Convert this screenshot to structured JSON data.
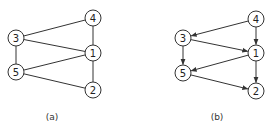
{
  "figures": [
    {
      "id": "a",
      "caption": "(a)",
      "caption_pos": [
        52,
        120
      ],
      "directed": false,
      "nodes": [
        {
          "id": "3",
          "label": "3",
          "x": 16,
          "y": 38
        },
        {
          "id": "5",
          "label": "5",
          "x": 16,
          "y": 72
        },
        {
          "id": "4",
          "label": "4",
          "x": 93,
          "y": 18
        },
        {
          "id": "1",
          "label": "1",
          "x": 93,
          "y": 53
        },
        {
          "id": "2",
          "label": "2",
          "x": 93,
          "y": 90
        }
      ],
      "edges": [
        {
          "from": "3",
          "to": "4"
        },
        {
          "from": "3",
          "to": "1"
        },
        {
          "from": "3",
          "to": "5"
        },
        {
          "from": "5",
          "to": "1"
        },
        {
          "from": "5",
          "to": "2"
        },
        {
          "from": "4",
          "to": "1"
        },
        {
          "from": "1",
          "to": "2"
        }
      ]
    },
    {
      "id": "b",
      "caption": "(b)",
      "caption_pos": [
        217,
        120
      ],
      "directed": true,
      "nodes": [
        {
          "id": "3",
          "label": "3",
          "x": 183,
          "y": 38
        },
        {
          "id": "5",
          "label": "5",
          "x": 183,
          "y": 73
        },
        {
          "id": "4",
          "label": "4",
          "x": 256,
          "y": 19
        },
        {
          "id": "1",
          "label": "1",
          "x": 256,
          "y": 53
        },
        {
          "id": "2",
          "label": "2",
          "x": 256,
          "y": 91
        }
      ],
      "edges": [
        {
          "from": "4",
          "to": "3"
        },
        {
          "from": "4",
          "to": "1"
        },
        {
          "from": "3",
          "to": "1"
        },
        {
          "from": "3",
          "to": "5"
        },
        {
          "from": "1",
          "to": "5"
        },
        {
          "from": "1",
          "to": "2"
        },
        {
          "from": "5",
          "to": "2"
        }
      ]
    }
  ],
  "style": {
    "node_radius": 8,
    "stroke_color": "#333333",
    "background": "#ffffff"
  }
}
